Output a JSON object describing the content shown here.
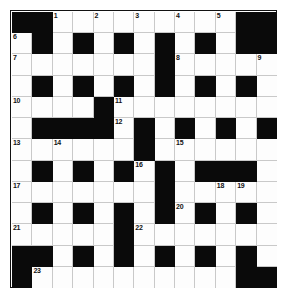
{
  "puzzle": {
    "kind": "crossword-grid",
    "rows": 13,
    "columns": 13,
    "colors": {
      "block": "#0a0a0a",
      "open": "#fdfdfd",
      "grid_line": "#c9c9c9",
      "border": "#111111",
      "number_text": "#111111",
      "page_background": "#ffffff"
    },
    "layout": {
      "grid": [
        [
          "block",
          "block",
          "open",
          "open",
          "open",
          "open",
          "open",
          "open",
          "open",
          "open",
          "open",
          "block",
          "block"
        ],
        [
          "open",
          "block",
          "open",
          "block",
          "open",
          "block",
          "open",
          "block",
          "open",
          "block",
          "open",
          "block",
          "block"
        ],
        [
          "open",
          "open",
          "open",
          "open",
          "open",
          "open",
          "open",
          "block",
          "open",
          "open",
          "open",
          "open",
          "open"
        ],
        [
          "open",
          "block",
          "open",
          "block",
          "open",
          "block",
          "open",
          "block",
          "open",
          "block",
          "open",
          "block",
          "open"
        ],
        [
          "open",
          "open",
          "open",
          "open",
          "block",
          "open",
          "open",
          "open",
          "open",
          "open",
          "open",
          "open",
          "open"
        ],
        [
          "open",
          "block",
          "block",
          "block",
          "block",
          "open",
          "block",
          "open",
          "block",
          "open",
          "block",
          "open",
          "block"
        ],
        [
          "open",
          "open",
          "open",
          "open",
          "open",
          "open",
          "block",
          "open",
          "open",
          "open",
          "open",
          "open",
          "open"
        ],
        [
          "open",
          "block",
          "open",
          "block",
          "open",
          "block",
          "open",
          "block",
          "open",
          "block",
          "block",
          "block",
          "open"
        ],
        [
          "open",
          "open",
          "open",
          "open",
          "open",
          "open",
          "open",
          "block",
          "open",
          "open",
          "open",
          "open",
          "open"
        ],
        [
          "open",
          "block",
          "open",
          "block",
          "open",
          "block",
          "open",
          "block",
          "open",
          "block",
          "open",
          "block",
          "open"
        ],
        [
          "open",
          "open",
          "open",
          "open",
          "open",
          "block",
          "open",
          "open",
          "open",
          "open",
          "open",
          "open",
          "open"
        ],
        [
          "block",
          "block",
          "open",
          "block",
          "open",
          "block",
          "open",
          "block",
          "open",
          "block",
          "open",
          "block",
          "open"
        ],
        [
          "block",
          "open",
          "open",
          "open",
          "open",
          "open",
          "open",
          "open",
          "open",
          "open",
          "open",
          "block",
          "block"
        ]
      ],
      "numbers": [
        {
          "row": 0,
          "col": 2,
          "label": "1"
        },
        {
          "row": 0,
          "col": 4,
          "label": "2"
        },
        {
          "row": 0,
          "col": 6,
          "label": "3"
        },
        {
          "row": 0,
          "col": 8,
          "label": "4"
        },
        {
          "row": 0,
          "col": 10,
          "label": "5"
        },
        {
          "row": 1,
          "col": 0,
          "label": "6"
        },
        {
          "row": 2,
          "col": 0,
          "label": "7"
        },
        {
          "row": 2,
          "col": 8,
          "label": "8"
        },
        {
          "row": 2,
          "col": 12,
          "label": "9"
        },
        {
          "row": 4,
          "col": 0,
          "label": "10"
        },
        {
          "row": 4,
          "col": 5,
          "label": "11"
        },
        {
          "row": 5,
          "col": 5,
          "label": "12"
        },
        {
          "row": 6,
          "col": 0,
          "label": "13"
        },
        {
          "row": 6,
          "col": 2,
          "label": "14"
        },
        {
          "row": 6,
          "col": 8,
          "label": "15"
        },
        {
          "row": 7,
          "col": 6,
          "label": "16"
        },
        {
          "row": 8,
          "col": 0,
          "label": "17"
        },
        {
          "row": 8,
          "col": 10,
          "label": "18"
        },
        {
          "row": 8,
          "col": 11,
          "label": "19"
        },
        {
          "row": 9,
          "col": 8,
          "label": "20"
        },
        {
          "row": 10,
          "col": 0,
          "label": "21"
        },
        {
          "row": 10,
          "col": 6,
          "label": "22"
        },
        {
          "row": 12,
          "col": 1,
          "label": "23"
        }
      ]
    }
  }
}
